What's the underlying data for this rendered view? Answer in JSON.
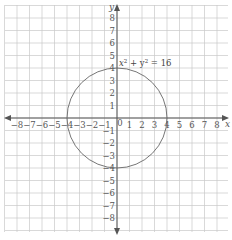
{
  "chart_data": {
    "type": "line",
    "title": "",
    "xlabel": "x",
    "ylabel": "y",
    "xlim": [
      -8.5,
      8.5
    ],
    "ylim": [
      -8.5,
      8.5
    ],
    "grid": true,
    "x_ticks": [
      -8,
      -7,
      -6,
      -5,
      -4,
      -3,
      -2,
      -1,
      0,
      1,
      2,
      3,
      4,
      5,
      6,
      7,
      8
    ],
    "y_ticks": [
      -8,
      -7,
      -6,
      -5,
      -4,
      -3,
      -2,
      -1,
      1,
      2,
      3,
      4,
      5,
      6,
      7,
      8
    ],
    "x_tick_labels": [
      "−8",
      "−7",
      "−6",
      "−5",
      "−4",
      "−3",
      "−2",
      "−1",
      "0",
      "1",
      "2",
      "3",
      "4",
      "5",
      "6",
      "7",
      "8"
    ],
    "y_tick_labels": [
      "−8",
      "−7",
      "−6",
      "−5",
      "−4",
      "−3",
      "−2",
      "−1",
      "1",
      "2",
      "3",
      "4",
      "5",
      "6",
      "7",
      "8"
    ],
    "series": [
      {
        "name": "x² + y² = 16",
        "shape": "circle",
        "center": [
          0,
          0
        ],
        "radius": 4
      }
    ],
    "annotations": [
      {
        "text_base": "x",
        "sup1": "2",
        "mid": " + y",
        "sup2": "2",
        "tail": " = 16",
        "x": 0.2,
        "y": 4.4
      }
    ]
  },
  "labels": {
    "x_axis": "x",
    "y_axis": "y",
    "equation_part1": "x",
    "equation_sup1": "2",
    "equation_part2": " + y",
    "equation_sup2": "2",
    "equation_part3": " = 16"
  }
}
